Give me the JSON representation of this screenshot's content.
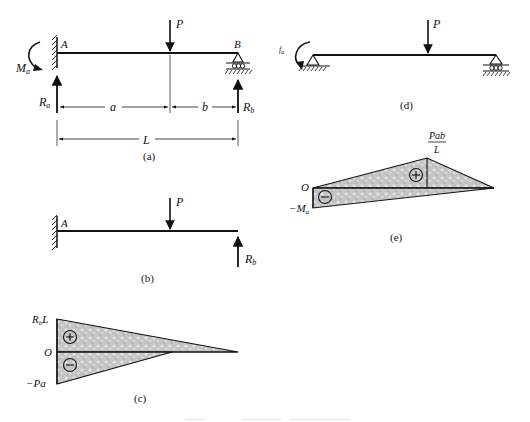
{
  "figure": {
    "panels": {
      "a": {
        "caption": "(a)",
        "labels": {
          "support_A": "A",
          "support_B": "B",
          "load": "P",
          "moment": "M",
          "moment_sub": "a",
          "reaction_A": "R",
          "reaction_A_sub": "a",
          "reaction_B": "R",
          "reaction_B_sub": "b",
          "dim_a": "a",
          "dim_b": "b",
          "dim_L": "L"
        }
      },
      "b": {
        "caption": "(b)",
        "labels": {
          "support_A": "A",
          "load": "P",
          "reaction_B": "R",
          "reaction_B_sub": "b"
        }
      },
      "c": {
        "caption": "(c)",
        "labels": {
          "top": "R",
          "top_sub": "b",
          "top_suffix": "L",
          "zero": "O",
          "bottom": "−Pa",
          "plus": "+",
          "minus": "−"
        }
      },
      "d": {
        "caption": "(d)",
        "labels": {
          "load": "P",
          "moment": "f",
          "moment_sub": "a"
        }
      },
      "e": {
        "caption": "(e)",
        "labels": {
          "peak_num": "Pab",
          "peak_den": "L",
          "zero": "O",
          "bottom": "−M",
          "bottom_sub": "a",
          "plus": "+",
          "minus": "−"
        }
      }
    },
    "colors": {
      "line": "#111111",
      "fill": "#c8c8c8",
      "fill_light": "#e2e2e2"
    }
  }
}
